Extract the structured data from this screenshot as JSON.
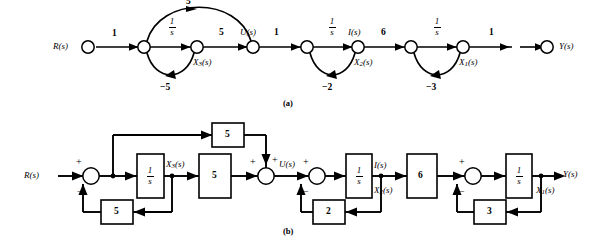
{
  "figure": {
    "panels": [
      {
        "id": "a",
        "caption": "(a)",
        "type": "signal-flow-graph"
      },
      {
        "id": "b",
        "caption": "(b)",
        "type": "block-diagram"
      }
    ]
  },
  "panel_a": {
    "caption": "(a)",
    "nodes": [
      {
        "id": "r",
        "label": "R(s)",
        "label_pos": "left"
      },
      {
        "id": "n1",
        "label": "",
        "label_pos": "none"
      },
      {
        "id": "x3",
        "label": "X3(s)",
        "label_pos": "below"
      },
      {
        "id": "u",
        "label": "U(s)",
        "label_pos": "above"
      },
      {
        "id": "n2",
        "label": "",
        "label_pos": "none"
      },
      {
        "id": "i",
        "label": "I(s)",
        "label_pos": "above",
        "label2": "X2(s)",
        "label2_pos": "below"
      },
      {
        "id": "n3",
        "label": "",
        "label_pos": "none"
      },
      {
        "id": "x1",
        "label": "X1(s)",
        "label_pos": "below"
      },
      {
        "id": "y",
        "label": "Y(s)",
        "label_pos": "right"
      }
    ],
    "branches": [
      {
        "from": "r",
        "to": "n1",
        "gain": "1",
        "shape": "straight",
        "side": "none"
      },
      {
        "from": "n1",
        "to": "x3",
        "gain": "1/s",
        "shape": "straight",
        "side": "above"
      },
      {
        "from": "x3",
        "to": "u",
        "gain": "5",
        "shape": "straight",
        "side": "above"
      },
      {
        "from": "n1",
        "to": "u",
        "gain": "5",
        "shape": "arc-up",
        "side": "above"
      },
      {
        "from": "x3",
        "to": "n1",
        "gain": "-5",
        "shape": "arc-down",
        "side": "below"
      },
      {
        "from": "u",
        "to": "n2",
        "gain": "1",
        "shape": "straight",
        "side": "above"
      },
      {
        "from": "n2",
        "to": "i",
        "gain": "1/s",
        "shape": "straight",
        "side": "above"
      },
      {
        "from": "i",
        "to": "n2",
        "gain": "-2",
        "shape": "arc-down",
        "side": "below"
      },
      {
        "from": "i",
        "to": "n3",
        "gain": "6",
        "shape": "straight",
        "side": "above"
      },
      {
        "from": "n3",
        "to": "x1",
        "gain": "1/s",
        "shape": "straight",
        "side": "above"
      },
      {
        "from": "x1",
        "to": "n3",
        "gain": "-3",
        "shape": "arc-down",
        "side": "below"
      },
      {
        "from": "x1",
        "to": "y",
        "gain": "1",
        "shape": "straight",
        "side": "above"
      }
    ],
    "gain_labels": [
      "1",
      "1/s",
      "5",
      "5",
      "-5",
      "1",
      "1/s",
      "-2",
      "6",
      "1/s",
      "-3",
      "1"
    ],
    "texts": {
      "R": "R(s)",
      "U": "U(s)",
      "I": "I(s)",
      "Y": "Y(s)",
      "X3": "X",
      "X3sub": "3",
      "X3tail": "(s)",
      "X2": "X",
      "X2sub": "2",
      "X2tail": "(s)",
      "X1": "X",
      "X1sub": "1",
      "X1tail": "(s)",
      "one_top": "1",
      "five_arc": "5",
      "five_mid": "5",
      "neg_five": "−5",
      "one_u": "1",
      "neg_two": "−2",
      "six": "6",
      "neg_three": "−3",
      "one_y": "1",
      "frac_num": "1",
      "frac_den": "s"
    }
  },
  "panel_b": {
    "caption": "(b)",
    "input_label": "R(s)",
    "output_label": "Y(s)",
    "blocks": [
      {
        "id": "int3",
        "text": "1/s",
        "kind": "integrator"
      },
      {
        "id": "ff5",
        "text": "5",
        "kind": "gain"
      },
      {
        "id": "fwd5",
        "text": "5",
        "kind": "gain"
      },
      {
        "id": "fb5",
        "text": "5",
        "kind": "gain"
      },
      {
        "id": "int2",
        "text": "1/s",
        "kind": "integrator"
      },
      {
        "id": "fb2",
        "text": "2",
        "kind": "gain"
      },
      {
        "id": "g6",
        "text": "6",
        "kind": "gain"
      },
      {
        "id": "int1",
        "text": "1/s",
        "kind": "integrator"
      },
      {
        "id": "fb3",
        "text": "3",
        "kind": "gain"
      }
    ],
    "summers": [
      {
        "id": "s1",
        "signs": {
          "left": "+",
          "bottom": "−"
        }
      },
      {
        "id": "s2",
        "signs": {
          "left": "+",
          "top": "+"
        }
      },
      {
        "id": "s3",
        "signs": {
          "left": "+",
          "bottom": "−"
        }
      },
      {
        "id": "s4",
        "signs": {
          "left": "+",
          "bottom": "−"
        }
      }
    ],
    "signal_labels": [
      {
        "text": "X3(s)",
        "at": "after-int3"
      },
      {
        "text": "U(s)",
        "at": "after-s2"
      },
      {
        "text": "I(s)",
        "at": "after-int2"
      },
      {
        "text": "X2(s)",
        "at": "below-I"
      },
      {
        "text": "X1(s)",
        "at": "after-int1"
      }
    ],
    "texts": {
      "R": "R(s)",
      "U": "U(s)",
      "I": "I(s)",
      "Y": "Y(s)",
      "X3": "X",
      "X3sub": "3",
      "X3tail": "(s)",
      "X2": "X",
      "X2sub": "2",
      "X2tail": "(s)",
      "X1": "X",
      "X1sub": "1",
      "X1tail": "(s)",
      "plus": "+",
      "minus": "−",
      "five_top": "5",
      "five_fwd": "5",
      "five_fb": "5",
      "two": "2",
      "six": "6",
      "three": "3",
      "frac_num": "1",
      "frac_den": "s"
    }
  }
}
